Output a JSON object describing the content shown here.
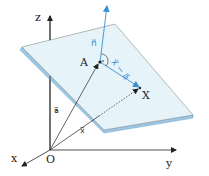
{
  "diagram": {
    "axes": {
      "z_label": "z",
      "y_label": "y",
      "x_label": "x",
      "origin_label": "O"
    },
    "points": {
      "A_label": "A",
      "X_label": "X"
    },
    "vectors": {
      "normal_label": "n⃗",
      "a_label": "a⃗",
      "x_label": "x⃗",
      "x_minus_a_label": "x⃗ − a⃗"
    },
    "colors": {
      "plane_fill": "#e6f4fa",
      "plane_edge": "#9cc8e4",
      "plane_outline": "#8a8a8a",
      "vector_blue": "#3b8fd0",
      "axis": "#222222"
    }
  }
}
